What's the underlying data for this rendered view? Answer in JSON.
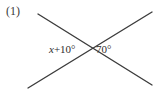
{
  "figure": {
    "number_label": "(1)",
    "background_color": "#ffffff",
    "line_color": "#3c3c3c",
    "text_color": "#2e2e2e",
    "width": 163,
    "height": 102
  },
  "labels": {
    "left_angle": {
      "variable": "x",
      "expression_rest": "+10°",
      "full_text": "x+10°"
    },
    "right_angle": {
      "full_text": "70°"
    }
  },
  "geometry": {
    "intersection": {
      "x": 89,
      "y": 50
    },
    "lines": [
      {
        "name": "line-descending",
        "x1": 38,
        "y1": 14,
        "x2": 152,
        "y2": 85
      },
      {
        "name": "line-ascending",
        "x1": 28,
        "y1": 88,
        "x2": 152,
        "y2": 12
      }
    ]
  }
}
